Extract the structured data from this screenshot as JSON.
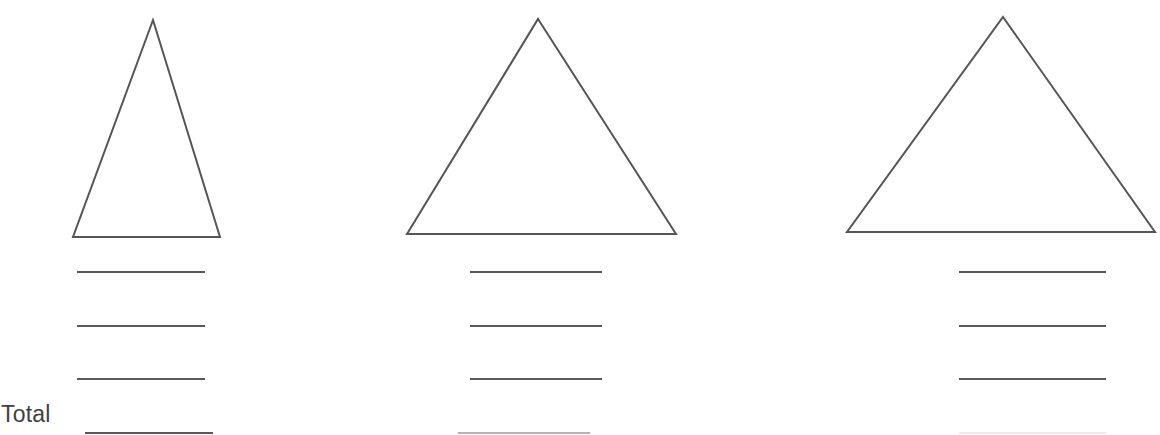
{
  "worksheet": {
    "title": "Triangle area worksheet",
    "background_color": "#ffffff",
    "width": 1160,
    "height": 435,
    "total_label": "Total",
    "stroke_color": "#555555",
    "rule_color": "#595959",
    "text_color": "#3f3f3f"
  },
  "figures": [
    {
      "name": "triangle-1",
      "label": "",
      "apex": {
        "x": 153,
        "y": 20
      },
      "base_left": {
        "x": 73,
        "y": 237
      },
      "base_right": {
        "x": 220,
        "y": 237
      },
      "base_width": 147,
      "height": 217,
      "stroke_width": 2
    },
    {
      "name": "triangle-2",
      "label": "",
      "apex": {
        "x": 538,
        "y": 19
      },
      "base_left": {
        "x": 407,
        "y": 234
      },
      "base_right": {
        "x": 676,
        "y": 234
      },
      "base_width": 269,
      "height": 215,
      "stroke_width": 2
    },
    {
      "name": "triangle-3",
      "label": "",
      "apex": {
        "x": 1003,
        "y": 17
      },
      "base_left": {
        "x": 847,
        "y": 232
      },
      "base_right": {
        "x": 1155,
        "y": 232
      },
      "base_width": 308,
      "height": 215,
      "stroke_width": 2
    }
  ],
  "answer_columns": [
    {
      "name": "answer-column-1",
      "blanks": [
        {
          "x1": 77,
          "x2": 205,
          "y": 272,
          "opacity": 1
        },
        {
          "x1": 77,
          "x2": 205,
          "y": 326,
          "opacity": 1
        },
        {
          "x1": 77,
          "x2": 205,
          "y": 379,
          "opacity": 1
        },
        {
          "x1": 85,
          "x2": 213,
          "y": 433,
          "opacity": 1
        }
      ]
    },
    {
      "name": "answer-column-2",
      "blanks": [
        {
          "x1": 470,
          "x2": 602,
          "y": 272,
          "opacity": 1
        },
        {
          "x1": 470,
          "x2": 602,
          "y": 326,
          "opacity": 1
        },
        {
          "x1": 470,
          "x2": 602,
          "y": 379,
          "opacity": 1
        },
        {
          "x1": 458,
          "x2": 590,
          "y": 433,
          "opacity": 0.45
        }
      ]
    },
    {
      "name": "answer-column-3",
      "blanks": [
        {
          "x1": 959,
          "x2": 1106,
          "y": 272,
          "opacity": 1
        },
        {
          "x1": 959,
          "x2": 1106,
          "y": 326,
          "opacity": 1
        },
        {
          "x1": 959,
          "x2": 1106,
          "y": 379,
          "opacity": 1
        },
        {
          "x1": 959,
          "x2": 1106,
          "y": 433,
          "opacity": 0.12
        }
      ]
    }
  ]
}
